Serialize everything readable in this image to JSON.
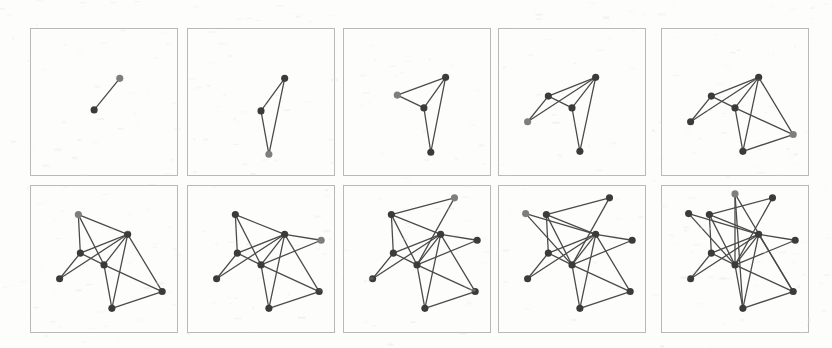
{
  "figure": {
    "panel_count": 10,
    "rows": 2,
    "columns": 5,
    "colors": {
      "node_fill": "#3b3b3b",
      "node_new_fill": "#7e7e7e",
      "edge_stroke": "#4a4a4a",
      "panel_border": "#b9b9b6",
      "background": "#fdfdfc"
    },
    "style": {
      "node_radius": 3.6,
      "edge_width": 1.3,
      "panel_width": 148,
      "panel_height": 148
    }
  },
  "chart_data": {
    "type": "diagram",
    "xlabel": "",
    "ylabel": "",
    "node_counts": [
      2,
      3,
      4,
      5,
      6,
      7,
      8,
      9,
      10,
      11
    ],
    "edge_counts": [
      1,
      3,
      5,
      7,
      10,
      13,
      15,
      17,
      19,
      22
    ],
    "panels": [
      {
        "index": 1,
        "label": "n = 2",
        "nodes": [
          {
            "id": "a",
            "x": 64,
            "y": 82,
            "new": false
          },
          {
            "id": "b",
            "x": 90,
            "y": 50,
            "new": true
          }
        ],
        "edges": [
          [
            "a",
            "b"
          ]
        ]
      },
      {
        "index": 2,
        "label": "n = 3",
        "nodes": [
          {
            "id": "a",
            "x": 74,
            "y": 83,
            "new": false
          },
          {
            "id": "b",
            "x": 98,
            "y": 50,
            "new": false
          },
          {
            "id": "c",
            "x": 82,
            "y": 127,
            "new": true
          }
        ],
        "edges": [
          [
            "a",
            "b"
          ],
          [
            "a",
            "c"
          ],
          [
            "b",
            "c"
          ]
        ]
      },
      {
        "index": 3,
        "label": "n = 4",
        "nodes": [
          {
            "id": "a",
            "x": 81,
            "y": 80,
            "new": false
          },
          {
            "id": "b",
            "x": 103,
            "y": 49,
            "new": false
          },
          {
            "id": "c",
            "x": 88,
            "y": 125,
            "new": false
          },
          {
            "id": "d",
            "x": 54,
            "y": 67,
            "new": true
          }
        ],
        "edges": [
          [
            "a",
            "b"
          ],
          [
            "a",
            "c"
          ],
          [
            "b",
            "c"
          ],
          [
            "d",
            "a"
          ],
          [
            "d",
            "b"
          ]
        ]
      },
      {
        "index": 4,
        "label": "n = 5",
        "nodes": [
          {
            "id": "a",
            "x": 74,
            "y": 80,
            "new": false
          },
          {
            "id": "b",
            "x": 98,
            "y": 49,
            "new": false
          },
          {
            "id": "c",
            "x": 82,
            "y": 124,
            "new": false
          },
          {
            "id": "d",
            "x": 50,
            "y": 68,
            "new": false
          },
          {
            "id": "e",
            "x": 29,
            "y": 94,
            "new": true
          }
        ],
        "edges": [
          [
            "a",
            "b"
          ],
          [
            "a",
            "c"
          ],
          [
            "b",
            "c"
          ],
          [
            "d",
            "a"
          ],
          [
            "d",
            "b"
          ],
          [
            "e",
            "d"
          ],
          [
            "e",
            "b"
          ]
        ]
      },
      {
        "index": 5,
        "label": "n = 6",
        "nodes": [
          {
            "id": "a",
            "x": 74,
            "y": 80,
            "new": false
          },
          {
            "id": "b",
            "x": 98,
            "y": 49,
            "new": false
          },
          {
            "id": "c",
            "x": 82,
            "y": 124,
            "new": false
          },
          {
            "id": "d",
            "x": 50,
            "y": 68,
            "new": false
          },
          {
            "id": "e",
            "x": 29,
            "y": 94,
            "new": false
          },
          {
            "id": "f",
            "x": 133,
            "y": 107,
            "new": true
          }
        ],
        "edges": [
          [
            "a",
            "b"
          ],
          [
            "a",
            "c"
          ],
          [
            "b",
            "c"
          ],
          [
            "d",
            "a"
          ],
          [
            "d",
            "b"
          ],
          [
            "e",
            "d"
          ],
          [
            "e",
            "b"
          ],
          [
            "f",
            "b"
          ],
          [
            "f",
            "a"
          ],
          [
            "f",
            "c"
          ]
        ]
      },
      {
        "index": 6,
        "label": "n = 7",
        "nodes": [
          {
            "id": "a",
            "x": 74,
            "y": 80,
            "new": false
          },
          {
            "id": "b",
            "x": 98,
            "y": 49,
            "new": false
          },
          {
            "id": "c",
            "x": 82,
            "y": 124,
            "new": false
          },
          {
            "id": "d",
            "x": 50,
            "y": 68,
            "new": false
          },
          {
            "id": "e",
            "x": 29,
            "y": 94,
            "new": false
          },
          {
            "id": "f",
            "x": 133,
            "y": 107,
            "new": false
          },
          {
            "id": "g",
            "x": 48,
            "y": 29,
            "new": true
          }
        ],
        "edges": [
          [
            "a",
            "b"
          ],
          [
            "a",
            "c"
          ],
          [
            "b",
            "c"
          ],
          [
            "d",
            "a"
          ],
          [
            "d",
            "b"
          ],
          [
            "e",
            "d"
          ],
          [
            "e",
            "b"
          ],
          [
            "f",
            "b"
          ],
          [
            "f",
            "a"
          ],
          [
            "f",
            "c"
          ],
          [
            "g",
            "d"
          ],
          [
            "g",
            "b"
          ],
          [
            "g",
            "a"
          ]
        ]
      },
      {
        "index": 7,
        "label": "n = 8",
        "nodes": [
          {
            "id": "a",
            "x": 74,
            "y": 80,
            "new": false
          },
          {
            "id": "b",
            "x": 98,
            "y": 49,
            "new": false
          },
          {
            "id": "c",
            "x": 82,
            "y": 124,
            "new": false
          },
          {
            "id": "d",
            "x": 50,
            "y": 68,
            "new": false
          },
          {
            "id": "e",
            "x": 29,
            "y": 94,
            "new": false
          },
          {
            "id": "f",
            "x": 133,
            "y": 107,
            "new": false
          },
          {
            "id": "g",
            "x": 48,
            "y": 29,
            "new": false
          },
          {
            "id": "h",
            "x": 135,
            "y": 55,
            "new": true
          }
        ],
        "edges": [
          [
            "a",
            "b"
          ],
          [
            "a",
            "c"
          ],
          [
            "b",
            "c"
          ],
          [
            "d",
            "a"
          ],
          [
            "d",
            "b"
          ],
          [
            "e",
            "d"
          ],
          [
            "e",
            "b"
          ],
          [
            "f",
            "b"
          ],
          [
            "f",
            "a"
          ],
          [
            "f",
            "c"
          ],
          [
            "g",
            "d"
          ],
          [
            "g",
            "b"
          ],
          [
            "g",
            "a"
          ],
          [
            "h",
            "b"
          ],
          [
            "h",
            "a"
          ]
        ]
      },
      {
        "index": 8,
        "label": "n = 9",
        "nodes": [
          {
            "id": "a",
            "x": 74,
            "y": 80,
            "new": false
          },
          {
            "id": "b",
            "x": 98,
            "y": 49,
            "new": false
          },
          {
            "id": "c",
            "x": 82,
            "y": 124,
            "new": false
          },
          {
            "id": "d",
            "x": 50,
            "y": 68,
            "new": false
          },
          {
            "id": "e",
            "x": 29,
            "y": 94,
            "new": false
          },
          {
            "id": "f",
            "x": 133,
            "y": 107,
            "new": false
          },
          {
            "id": "g",
            "x": 48,
            "y": 29,
            "new": false
          },
          {
            "id": "h",
            "x": 135,
            "y": 55,
            "new": false
          },
          {
            "id": "i",
            "x": 112,
            "y": 12,
            "new": true
          }
        ],
        "edges": [
          [
            "a",
            "b"
          ],
          [
            "a",
            "c"
          ],
          [
            "b",
            "c"
          ],
          [
            "d",
            "a"
          ],
          [
            "d",
            "b"
          ],
          [
            "e",
            "d"
          ],
          [
            "e",
            "b"
          ],
          [
            "f",
            "b"
          ],
          [
            "f",
            "a"
          ],
          [
            "f",
            "c"
          ],
          [
            "g",
            "d"
          ],
          [
            "g",
            "b"
          ],
          [
            "g",
            "a"
          ],
          [
            "h",
            "b"
          ],
          [
            "h",
            "a"
          ],
          [
            "i",
            "g"
          ],
          [
            "i",
            "a"
          ]
        ]
      },
      {
        "index": 9,
        "label": "n = 10",
        "nodes": [
          {
            "id": "a",
            "x": 74,
            "y": 80,
            "new": false
          },
          {
            "id": "b",
            "x": 98,
            "y": 49,
            "new": false
          },
          {
            "id": "c",
            "x": 82,
            "y": 124,
            "new": false
          },
          {
            "id": "d",
            "x": 50,
            "y": 68,
            "new": false
          },
          {
            "id": "e",
            "x": 29,
            "y": 94,
            "new": false
          },
          {
            "id": "f",
            "x": 133,
            "y": 107,
            "new": false
          },
          {
            "id": "g",
            "x": 48,
            "y": 29,
            "new": false
          },
          {
            "id": "h",
            "x": 135,
            "y": 55,
            "new": false
          },
          {
            "id": "i",
            "x": 112,
            "y": 12,
            "new": false
          },
          {
            "id": "j",
            "x": 27,
            "y": 28,
            "new": true
          }
        ],
        "edges": [
          [
            "a",
            "b"
          ],
          [
            "a",
            "c"
          ],
          [
            "b",
            "c"
          ],
          [
            "d",
            "a"
          ],
          [
            "d",
            "b"
          ],
          [
            "e",
            "d"
          ],
          [
            "e",
            "b"
          ],
          [
            "f",
            "b"
          ],
          [
            "f",
            "a"
          ],
          [
            "f",
            "c"
          ],
          [
            "g",
            "d"
          ],
          [
            "g",
            "b"
          ],
          [
            "g",
            "a"
          ],
          [
            "h",
            "b"
          ],
          [
            "h",
            "a"
          ],
          [
            "i",
            "g"
          ],
          [
            "i",
            "a"
          ],
          [
            "j",
            "b"
          ],
          [
            "j",
            "a"
          ]
        ]
      },
      {
        "index": 10,
        "label": "n = 11",
        "nodes": [
          {
            "id": "a",
            "x": 74,
            "y": 80,
            "new": false
          },
          {
            "id": "b",
            "x": 98,
            "y": 49,
            "new": false
          },
          {
            "id": "c",
            "x": 82,
            "y": 124,
            "new": false
          },
          {
            "id": "d",
            "x": 50,
            "y": 68,
            "new": false
          },
          {
            "id": "e",
            "x": 29,
            "y": 94,
            "new": false
          },
          {
            "id": "f",
            "x": 133,
            "y": 107,
            "new": false
          },
          {
            "id": "g",
            "x": 48,
            "y": 29,
            "new": false
          },
          {
            "id": "h",
            "x": 135,
            "y": 55,
            "new": false
          },
          {
            "id": "i",
            "x": 112,
            "y": 12,
            "new": false
          },
          {
            "id": "j",
            "x": 27,
            "y": 28,
            "new": false
          },
          {
            "id": "k",
            "x": 74,
            "y": 8,
            "new": true
          }
        ],
        "edges": [
          [
            "a",
            "b"
          ],
          [
            "a",
            "c"
          ],
          [
            "b",
            "c"
          ],
          [
            "d",
            "a"
          ],
          [
            "d",
            "b"
          ],
          [
            "e",
            "d"
          ],
          [
            "e",
            "b"
          ],
          [
            "f",
            "b"
          ],
          [
            "f",
            "a"
          ],
          [
            "f",
            "c"
          ],
          [
            "g",
            "d"
          ],
          [
            "g",
            "b"
          ],
          [
            "g",
            "a"
          ],
          [
            "h",
            "b"
          ],
          [
            "h",
            "a"
          ],
          [
            "i",
            "g"
          ],
          [
            "i",
            "a"
          ],
          [
            "j",
            "b"
          ],
          [
            "j",
            "a"
          ],
          [
            "k",
            "a"
          ],
          [
            "k",
            "c"
          ],
          [
            "k",
            "f"
          ]
        ]
      }
    ]
  },
  "layout": {
    "panel_origins": [
      {
        "x": 30,
        "y": 28
      },
      {
        "x": 187,
        "y": 28
      },
      {
        "x": 343,
        "y": 28
      },
      {
        "x": 498,
        "y": 28
      },
      {
        "x": 661,
        "y": 28
      },
      {
        "x": 30,
        "y": 185
      },
      {
        "x": 187,
        "y": 185
      },
      {
        "x": 343,
        "y": 185
      },
      {
        "x": 498,
        "y": 185
      },
      {
        "x": 661,
        "y": 185
      }
    ]
  }
}
